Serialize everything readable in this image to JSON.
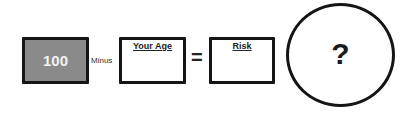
{
  "equation": {
    "operand_box": {
      "value": "100",
      "fill_color": "#8a8a8a"
    },
    "operator_minus": "Minus",
    "age_box": {
      "label": "Your Age",
      "value": ""
    },
    "operator_equals": "=",
    "risk_box": {
      "label": "Risk",
      "value": ""
    },
    "result_circle": {
      "symbol": "?"
    }
  }
}
